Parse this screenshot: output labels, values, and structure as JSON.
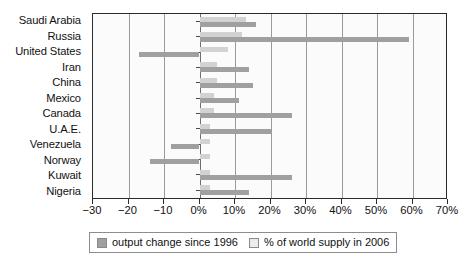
{
  "chart_data": {
    "type": "bar",
    "orientation": "horizontal",
    "title": "",
    "xlabel": "",
    "ylabel": "",
    "xlim": [
      -30,
      70
    ],
    "xticks": [
      -30,
      -20,
      -10,
      0,
      10,
      20,
      30,
      40,
      50,
      60,
      70
    ],
    "xtick_labels": [
      "−30",
      "−20",
      "−10",
      "0%",
      "10%",
      "20%",
      "30%",
      "40%",
      "50%",
      "60%",
      "70%"
    ],
    "grid": true,
    "legend_position": "bottom",
    "categories": [
      "Saudi Arabia",
      "Russia",
      "United States",
      "Iran",
      "China",
      "Mexico",
      "Canada",
      "U.A.E.",
      "Venezuela",
      "Norway",
      "Kuwait",
      "Nigeria"
    ],
    "series": [
      {
        "name": "% of world supply in 2006",
        "color": "#d2d2d2",
        "values": [
          13,
          12,
          8,
          5,
          5,
          4,
          4,
          3,
          3,
          3,
          3,
          3
        ]
      },
      {
        "name": "output change since 1996",
        "color": "#a0a0a0",
        "values": [
          16,
          59,
          -17,
          14,
          15,
          11,
          26,
          20,
          -8,
          -14,
          26,
          14
        ]
      }
    ]
  },
  "legend": {
    "items": [
      {
        "label": "output change since 1996",
        "swatch": "dark"
      },
      {
        "label": "% of world supply in 2006",
        "swatch": "light"
      }
    ]
  },
  "colors": {
    "bar_change": "#a0a0a0",
    "bar_supply": "#d2d2d2",
    "axis": "#2b2b2b",
    "grid": "#9a9a9a",
    "plot_background": "#fbfbfb"
  }
}
